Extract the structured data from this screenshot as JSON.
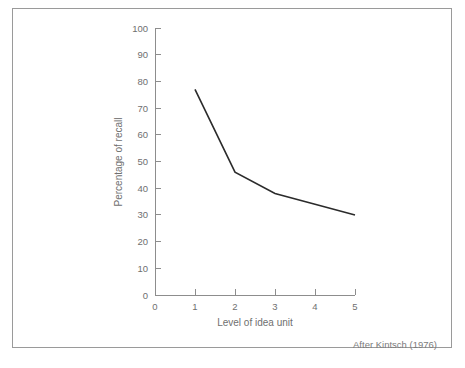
{
  "figure": {
    "credit": "After Kintsch (1976)",
    "frame_color": "#9a9a9a",
    "axis_color": "#8d8d8d",
    "text_color": "#6f6f6f",
    "line_color": "#2b2b2b",
    "background": "#ffffff"
  },
  "chart_data": {
    "type": "line",
    "title": "",
    "xlabel": "Level of idea unit",
    "ylabel": "Percentage of recall",
    "x": [
      1,
      2,
      3,
      4,
      5
    ],
    "values": [
      77,
      46,
      38,
      34,
      30
    ],
    "series": [
      {
        "name": "Percentage of recall",
        "values": [
          77,
          46,
          38,
          34,
          30
        ]
      }
    ],
    "xlim": [
      0,
      5
    ],
    "ylim": [
      0,
      100
    ],
    "xticks": [
      0,
      1,
      2,
      3,
      4,
      5
    ],
    "xticklabels": [
      "0",
      "1",
      "2",
      "3",
      "4",
      "5"
    ],
    "yticks": [
      0,
      10,
      20,
      30,
      40,
      50,
      60,
      70,
      80,
      90,
      100
    ],
    "yticklabels": [
      "0",
      "10",
      "20",
      "30",
      "40",
      "50",
      "60",
      "70",
      "80",
      "90",
      "100"
    ],
    "grid": false,
    "legend": false,
    "annotations": [
      "After Kintsch (1976)"
    ]
  }
}
